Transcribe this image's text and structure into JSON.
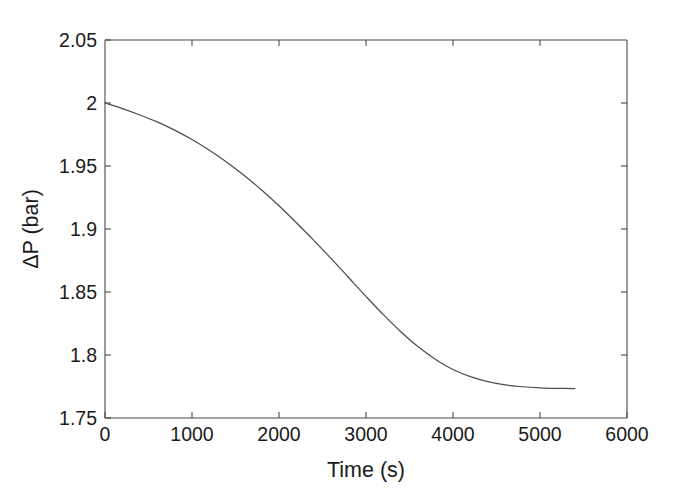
{
  "figure": {
    "background_color": "#ffffff",
    "axes_color": "#4a4a4a",
    "curve_color": "#4d4d4d"
  },
  "chart_data": {
    "type": "line",
    "title": "",
    "subtitle": "",
    "xlabel": "Time (s)",
    "ylabel": "ΔP (bar)",
    "xlim": [
      0,
      6000
    ],
    "ylim": [
      1.75,
      2.05
    ],
    "xticks": [
      0,
      1000,
      2000,
      3000,
      4000,
      5000,
      6000
    ],
    "xticklabels": [
      "0",
      "1000",
      "2000",
      "3000",
      "4000",
      "5000",
      "6000"
    ],
    "yticks": [
      1.75,
      1.8,
      1.85,
      1.9,
      1.95,
      2,
      2.05
    ],
    "yticklabels": [
      "1.75",
      "1.8",
      "1.85",
      "1.9",
      "1.95",
      "2",
      "2.05"
    ],
    "grid": false,
    "legend": null,
    "legend_position": "none",
    "annotations": [],
    "series": [
      {
        "name": "ΔP",
        "color": "#4d4d4d",
        "linewidth": 1.25,
        "x": [
          0,
          200,
          400,
          600,
          800,
          1000,
          1200,
          1400,
          1600,
          1800,
          2000,
          2200,
          2400,
          2600,
          2800,
          3000,
          3200,
          3400,
          3600,
          3800,
          4000,
          4200,
          4400,
          4600,
          4800,
          5000,
          5200,
          5400
        ],
        "y": [
          2.0,
          1.9955,
          1.9905,
          1.985,
          1.9785,
          1.971,
          1.9625,
          1.953,
          1.9425,
          1.931,
          1.9185,
          1.905,
          1.891,
          1.8765,
          1.8615,
          1.8465,
          1.832,
          1.8185,
          1.8065,
          1.7965,
          1.7885,
          1.7828,
          1.7788,
          1.7762,
          1.7748,
          1.774,
          1.7736,
          1.7734
        ]
      }
    ]
  },
  "axis": {
    "x_tick_0": "0",
    "x_tick_1": "1000",
    "x_tick_2": "2000",
    "x_tick_3": "3000",
    "x_tick_4": "4000",
    "x_tick_5": "5000",
    "x_tick_6": "6000",
    "y_tick_0": "1.75",
    "y_tick_1": "1.8",
    "y_tick_2": "1.85",
    "y_tick_3": "1.9",
    "y_tick_4": "1.95",
    "y_tick_5": "2",
    "y_tick_6": "2.05",
    "x_title": "Time (s)",
    "y_title": "ΔP (bar)"
  }
}
